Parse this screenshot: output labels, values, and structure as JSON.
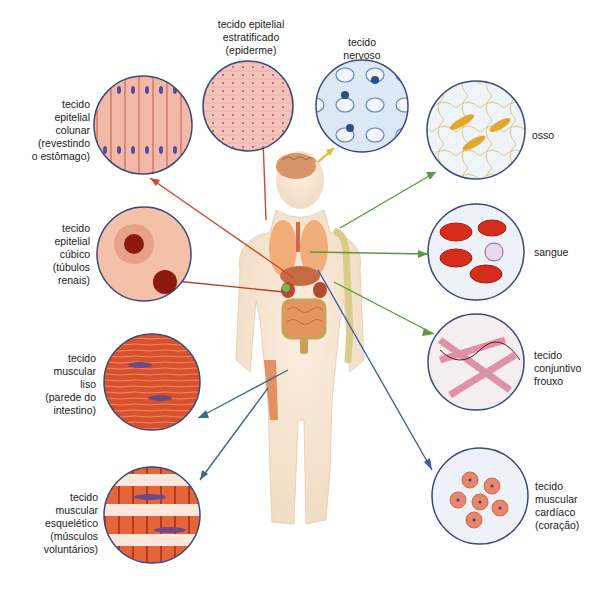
{
  "diagram": {
    "center_figure": "human-body-with-organs",
    "tissues": [
      {
        "id": "columnar",
        "lines": [
          "tecido",
          "epitelial",
          "colunar",
          "(revestindo",
          "o estômago)"
        ],
        "arrow_color": "#d0492a"
      },
      {
        "id": "stratified",
        "lines": [
          "tecido epitelial",
          "estratificado",
          "(epiderme)"
        ],
        "arrow_color": "#d0492a"
      },
      {
        "id": "nervous",
        "lines": [
          "tecido",
          "nervoso"
        ],
        "arrow_color": "#d8c020"
      },
      {
        "id": "bone",
        "lines": [
          "osso"
        ],
        "arrow_color": "#5a9a3a"
      },
      {
        "id": "cuboidal",
        "lines": [
          "tecido",
          "epitelial",
          "cúbico",
          "(túbulos",
          "renais)"
        ],
        "arrow_color": "#b0402a"
      },
      {
        "id": "blood",
        "lines": [
          "sangue"
        ],
        "arrow_color": "#5a9a3a"
      },
      {
        "id": "smooth",
        "lines": [
          "tecido",
          "muscular",
          "liso",
          "(parede do",
          "intestino)"
        ],
        "arrow_color": "#3a6a8a"
      },
      {
        "id": "loose",
        "lines": [
          "tecido",
          "conjuntivo",
          "frouxo"
        ],
        "arrow_color": "#5a9a3a"
      },
      {
        "id": "skeletal",
        "lines": [
          "tecido",
          "muscular",
          "esquelético",
          "(músculos",
          "voluntários)"
        ],
        "arrow_color": "#3a6a8a"
      },
      {
        "id": "cardiac",
        "lines": [
          "tecido",
          "muscular",
          "cardíaco",
          "(coração)"
        ],
        "arrow_color": "#3a5aa0"
      }
    ]
  }
}
